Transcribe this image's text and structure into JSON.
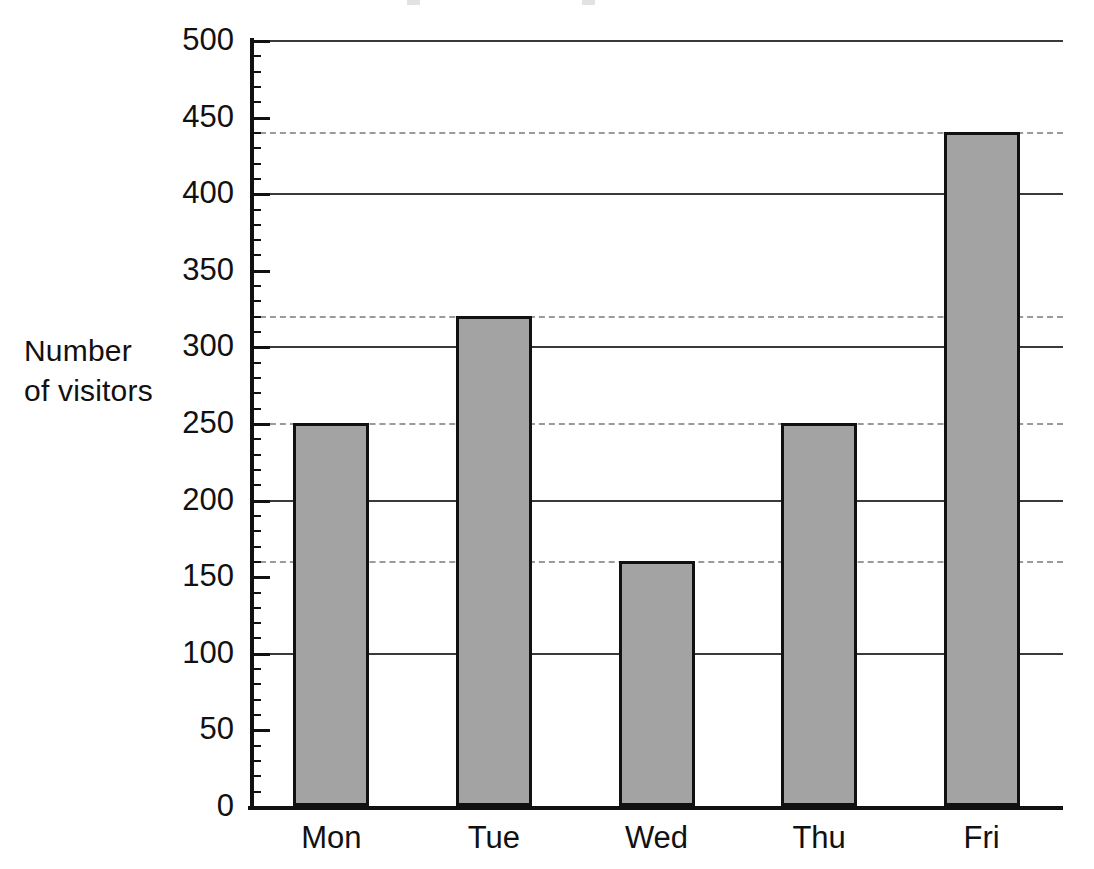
{
  "chart_data": {
    "type": "bar",
    "title": "",
    "xlabel": "",
    "ylabel": "Number\nof visitors",
    "categories": [
      "Mon",
      "Tue",
      "Wed",
      "Thu",
      "Fri"
    ],
    "values": [
      250,
      320,
      160,
      250,
      440
    ],
    "ylim": [
      0,
      500
    ],
    "ytick_labels": [
      "0",
      "50",
      "100",
      "150",
      "200",
      "250",
      "300",
      "350",
      "400",
      "450",
      "500"
    ],
    "ytick_values": [
      0,
      50,
      100,
      150,
      200,
      250,
      300,
      350,
      400,
      450,
      500
    ],
    "ytick_major_step": 50,
    "ytick_minor_step": 10,
    "gridlines_solid": [
      100,
      200,
      300,
      400,
      500
    ],
    "gridlines_dashed": [
      160,
      250,
      320,
      440
    ],
    "grid": true,
    "legend": "none",
    "bar_fill_color": "#a3a3a3",
    "bar_edge_color": "#111111",
    "axis_color": "#111111",
    "grid_color": "#3a3a3a",
    "dashed_grid_color": "#9a9a9a",
    "background_color": "#ffffff"
  },
  "axis": {
    "y_title_line1": "Number",
    "y_title_line2": "of visitors"
  }
}
